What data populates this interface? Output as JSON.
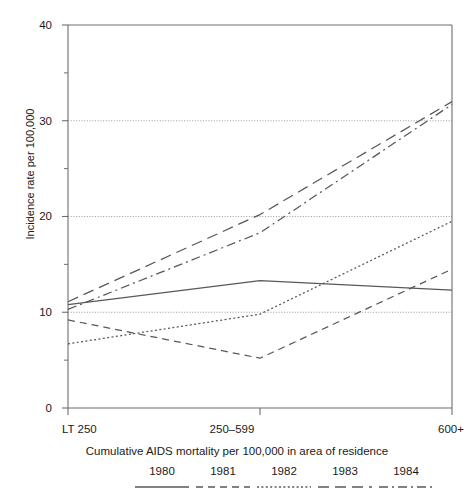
{
  "chart_data": {
    "type": "line",
    "title": "",
    "xlabel": "Cumulative AIDS mortality per 100,000 in area of residence",
    "ylabel": "Incidence rate per 100,000",
    "categories": [
      "LT 250",
      "250–599",
      "600+"
    ],
    "x": [
      0,
      1,
      2
    ],
    "ylim": [
      0,
      40
    ],
    "yticks": [
      0,
      10,
      20,
      30,
      40
    ],
    "yticklabels": [
      "0",
      "10",
      "20",
      "30",
      "40"
    ],
    "yminorticks": [
      5,
      15,
      25,
      35
    ],
    "grid": "horizontal-dotted",
    "legend_position": "bottom",
    "series": [
      {
        "name": "1980",
        "style": "solid",
        "values": [
          10.8,
          13.3,
          12.3
        ]
      },
      {
        "name": "1981",
        "style": "dashed",
        "values": [
          9.2,
          5.2,
          14.5
        ]
      },
      {
        "name": "1982",
        "style": "dotted",
        "values": [
          6.7,
          9.8,
          19.5
        ]
      },
      {
        "name": "1983",
        "style": "longdash",
        "values": [
          11.1,
          20.2,
          32.0
        ]
      },
      {
        "name": "1984",
        "style": "dashdot",
        "values": [
          10.3,
          18.3,
          31.7
        ]
      }
    ]
  },
  "axes": {
    "y_labels": [
      "40",
      "30",
      "20",
      "10",
      "0"
    ],
    "x_labels": [
      "LT 250",
      "250–599",
      "600+"
    ],
    "y_axis_title": "Incidence rate per 100,000",
    "x_axis_title": "Cumulative AIDS mortality per 100,000 in area of residence"
  },
  "legend": {
    "items": [
      {
        "label": "1980",
        "style": "solid"
      },
      {
        "label": "1981",
        "style": "dashed"
      },
      {
        "label": "1982",
        "style": "dotted"
      },
      {
        "label": "1983",
        "style": "longdash"
      },
      {
        "label": "1984",
        "style": "dashdot"
      }
    ]
  },
  "colors": {
    "line": "#55585c",
    "axis": "#6b6e72",
    "grid": "#8d9094",
    "text": "#1a1a1a"
  }
}
